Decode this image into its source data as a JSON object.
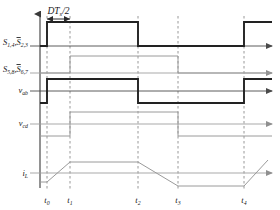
{
  "figure": {
    "type": "timing-diagram",
    "title": "",
    "background": "#ffffff",
    "axis_color": "#4a4a4a",
    "dash_color": "#8c8c8c",
    "trace_dark": "#222222",
    "trace_light": "#9a9a9a"
  },
  "annotation": {
    "span_label": "DT",
    "span_sub": "s",
    "span_tail": "/2",
    "from_time": "t0",
    "to_time": "t1"
  },
  "time_axis": {
    "ticks": [
      {
        "id": "t0",
        "base": "t",
        "sub": "0",
        "x": 47
      },
      {
        "id": "t1",
        "base": "t",
        "sub": "1",
        "x": 70
      },
      {
        "id": "t2",
        "base": "t",
        "sub": "2",
        "x": 138
      },
      {
        "id": "t3",
        "base": "t",
        "sub": "3",
        "x": 178
      },
      {
        "id": "t4",
        "base": "t",
        "sub": "4",
        "x": 244
      }
    ],
    "x_start": 40,
    "x_end": 272
  },
  "traces": [
    {
      "name": "s14-s23-gate",
      "label_parts": [
        {
          "base": "S",
          "sub": "1,4",
          "overbar": false
        },
        {
          "base": "S",
          "sub": "2,3",
          "overbar": true
        }
      ],
      "label_plain": "S1,4 S2,3",
      "kind": "square",
      "style": "dark",
      "baseline_y": 46,
      "high_y": 22,
      "low_y": 46,
      "segments": [
        {
          "from_x": 40,
          "to_x": 47,
          "level": "low"
        },
        {
          "from_x": 47,
          "to_x": 138,
          "level": "high"
        },
        {
          "from_x": 138,
          "to_x": 244,
          "level": "low"
        },
        {
          "from_x": 244,
          "to_x": 272,
          "level": "high"
        }
      ]
    },
    {
      "name": "s58-s67-gate",
      "label_parts": [
        {
          "base": "S",
          "sub": "5,8",
          "overbar": false
        },
        {
          "base": "S",
          "sub": "6,7",
          "overbar": true
        }
      ],
      "label_plain": "S5,8 S6,7",
      "kind": "square",
      "style": "light",
      "baseline_y": 73,
      "high_y": 56,
      "low_y": 73,
      "segments": [
        {
          "from_x": 40,
          "to_x": 70,
          "level": "low"
        },
        {
          "from_x": 70,
          "to_x": 178,
          "level": "high"
        },
        {
          "from_x": 178,
          "to_x": 272,
          "level": "low"
        }
      ]
    },
    {
      "name": "vab-voltage",
      "label_parts": [
        {
          "base": "v",
          "sub": "ab",
          "overbar": false
        }
      ],
      "label_plain": "vab",
      "kind": "bipolar",
      "style": "dark",
      "baseline_y": 91,
      "high_y": 79,
      "low_y": 103,
      "segments": [
        {
          "from_x": 40,
          "to_x": 47,
          "level": "low"
        },
        {
          "from_x": 47,
          "to_x": 138,
          "level": "high"
        },
        {
          "from_x": 138,
          "to_x": 244,
          "level": "low"
        },
        {
          "from_x": 244,
          "to_x": 272,
          "level": "high"
        }
      ]
    },
    {
      "name": "vcd-voltage",
      "label_parts": [
        {
          "base": "v",
          "sub": "cd",
          "overbar": false
        }
      ],
      "label_plain": "vcd",
      "kind": "bipolar",
      "style": "light",
      "baseline_y": 124,
      "high_y": 112,
      "low_y": 136,
      "segments": [
        {
          "from_x": 40,
          "to_x": 70,
          "level": "low"
        },
        {
          "from_x": 70,
          "to_x": 178,
          "level": "high"
        },
        {
          "from_x": 178,
          "to_x": 272,
          "level": "low"
        }
      ]
    },
    {
      "name": "il-current",
      "label_parts": [
        {
          "base": "i",
          "sub": "L",
          "overbar": false
        }
      ],
      "label_plain": "iL",
      "kind": "trapezoid",
      "style": "light",
      "baseline_y": 173,
      "points": [
        {
          "x": 40,
          "y": 182
        },
        {
          "x": 47,
          "y": 182
        },
        {
          "x": 70,
          "y": 162
        },
        {
          "x": 138,
          "y": 162
        },
        {
          "x": 178,
          "y": 186
        },
        {
          "x": 244,
          "y": 186
        },
        {
          "x": 268,
          "y": 160
        }
      ]
    }
  ]
}
